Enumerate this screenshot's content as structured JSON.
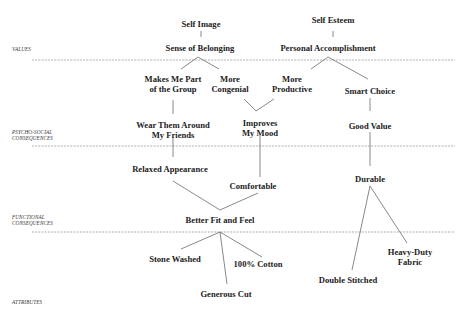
{
  "levels": [
    {
      "id": "values",
      "label": "VALUES"
    },
    {
      "id": "psycho",
      "label": "PSYCHO-SOCIAL CONSEQUENCES",
      "line1": "PSYCHO-SOCIAL",
      "line2": "CONSEQUENCES"
    },
    {
      "id": "functional",
      "label": "FUNCTIONAL CONSEQUENCES",
      "line1": "FUNCTIONAL",
      "line2": "CONSEQUENCES"
    },
    {
      "id": "attributes",
      "label": "ATTRIBUTES"
    }
  ],
  "nodes": {
    "self_image": "Self Image",
    "self_esteem": "Self Esteem",
    "sense_of_belonging": "Sense of Belonging",
    "personal_accomplishment": "Personal Accomplishment",
    "makes_me_part": {
      "line1": "Makes Me Part",
      "line2": "of the Group"
    },
    "more_congenial": {
      "line1": "More",
      "line2": "Congenial"
    },
    "more_productive": {
      "line1": "More",
      "line2": "Productive"
    },
    "smart_choice": "Smart Choice",
    "wear_them_around": {
      "line1": "Wear Them Around",
      "line2": "My Friends"
    },
    "improves_my_mood": {
      "line1": "Improves",
      "line2": "My Mood"
    },
    "good_value": "Good Value",
    "relaxed_appearance": "Relaxed Appearance",
    "comfortable": "Comfortable",
    "durable": "Durable",
    "better_fit_and_feel": "Better Fit and Feel",
    "stone_washed": "Stone Washed",
    "generous_cut": "Generous Cut",
    "cotton_100": "100% Cotton",
    "heavy_duty_fabric": {
      "line1": "Heavy-Duty",
      "line2": "Fabric"
    },
    "double_stitched": "Double Stitched"
  },
  "edges": [
    [
      "self_image",
      "sense_of_belonging"
    ],
    [
      "self_esteem",
      "personal_accomplishment"
    ],
    [
      "sense_of_belonging",
      "makes_me_part"
    ],
    [
      "sense_of_belonging",
      "more_congenial"
    ],
    [
      "personal_accomplishment",
      "more_productive"
    ],
    [
      "personal_accomplishment",
      "smart_choice"
    ],
    [
      "makes_me_part",
      "wear_them_around"
    ],
    [
      "more_congenial",
      "improves_my_mood"
    ],
    [
      "more_productive",
      "improves_my_mood"
    ],
    [
      "smart_choice",
      "good_value"
    ],
    [
      "wear_them_around",
      "relaxed_appearance"
    ],
    [
      "improves_my_mood",
      "comfortable"
    ],
    [
      "good_value",
      "durable"
    ],
    [
      "relaxed_appearance",
      "better_fit_and_feel"
    ],
    [
      "comfortable",
      "better_fit_and_feel"
    ],
    [
      "better_fit_and_feel",
      "stone_washed"
    ],
    [
      "better_fit_and_feel",
      "generous_cut"
    ],
    [
      "better_fit_and_feel",
      "cotton_100"
    ],
    [
      "durable",
      "double_stitched"
    ],
    [
      "durable",
      "heavy_duty_fabric"
    ]
  ],
  "colors": {
    "text": "#1c1c1c",
    "line": "#666666",
    "divider": "#999999"
  }
}
